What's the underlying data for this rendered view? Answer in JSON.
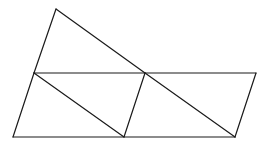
{
  "diagram": {
    "type": "geometric-figure",
    "stroke_color": "#1a1a1a",
    "background": "#ffffff",
    "vertices": {
      "T": [
        56,
        9
      ],
      "L": [
        34,
        73
      ],
      "M": [
        145,
        73
      ],
      "R": [
        256,
        73
      ],
      "BL": [
        13,
        137
      ],
      "BM": [
        124,
        137
      ],
      "BR": [
        235,
        137
      ]
    },
    "edges": [
      [
        "T",
        "L"
      ],
      [
        "T",
        "M"
      ],
      [
        "L",
        "R"
      ],
      [
        "L",
        "BL"
      ],
      [
        "L",
        "BM"
      ],
      [
        "M",
        "BM"
      ],
      [
        "M",
        "BR"
      ],
      [
        "R",
        "BR"
      ],
      [
        "BL",
        "BR"
      ]
    ]
  }
}
